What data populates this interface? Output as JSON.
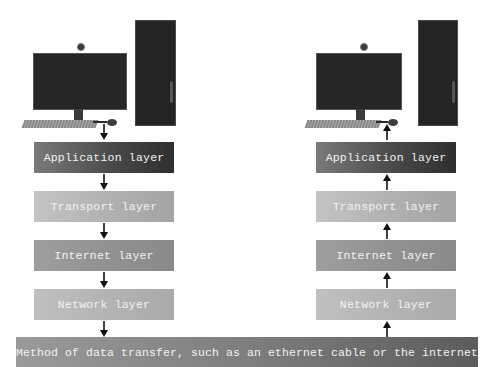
{
  "left_stack": {
    "role": "sender",
    "arrow_direction": "down",
    "layers": [
      {
        "label": "Application layer"
      },
      {
        "label": "Transport layer"
      },
      {
        "label": "Internet layer"
      },
      {
        "label": "Network layer"
      }
    ]
  },
  "right_stack": {
    "role": "receiver",
    "arrow_direction": "up",
    "layers": [
      {
        "label": "Application layer"
      },
      {
        "label": "Transport layer"
      },
      {
        "label": "Internet layer"
      },
      {
        "label": "Network layer"
      }
    ]
  },
  "medium": {
    "label": "Method of data transfer, such as an ethernet cable or the internet"
  },
  "colors": {
    "application": "#4a4a4a",
    "transport": "#b2b2b2",
    "internet": "#929292",
    "network": "#b4b4b4",
    "medium": "#7e7e7e",
    "text": "#f2f2f2",
    "arrow": "#111111"
  }
}
